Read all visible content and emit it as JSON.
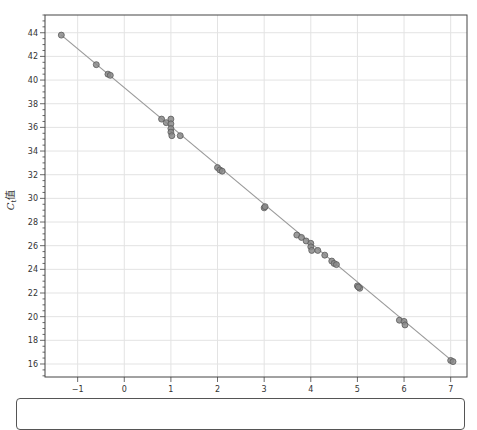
{
  "chart_data": {
    "type": "scatter",
    "title": "",
    "xlabel": "浓度",
    "ylabel_main": "C",
    "ylabel_sub": "t",
    "ylabel_suffix": "值",
    "xlim": [
      -1.7,
      7.35
    ],
    "ylim": [
      14.9,
      45.5
    ],
    "xticks": [
      -1,
      0,
      1,
      2,
      3,
      4,
      5,
      6,
      7
    ],
    "yticks": [
      16,
      18,
      20,
      22,
      24,
      26,
      28,
      30,
      32,
      34,
      36,
      38,
      40,
      42,
      44
    ],
    "grid": true,
    "legend": null,
    "regression_line": {
      "x": [
        -1.35,
        7.05
      ],
      "y": [
        43.8,
        16.2
      ]
    },
    "series": [
      {
        "name": "samples",
        "points": [
          [
            -1.35,
            43.8
          ],
          [
            -0.6,
            41.3
          ],
          [
            -0.35,
            40.5
          ],
          [
            -0.3,
            40.4
          ],
          [
            0.8,
            36.7
          ],
          [
            0.9,
            36.4
          ],
          [
            1.0,
            36.7
          ],
          [
            1.0,
            36.3
          ],
          [
            1.0,
            35.9
          ],
          [
            1.0,
            35.6
          ],
          [
            1.02,
            35.3
          ],
          [
            1.2,
            35.3
          ],
          [
            2.0,
            32.6
          ],
          [
            2.05,
            32.4
          ],
          [
            2.1,
            32.3
          ],
          [
            3.0,
            29.2
          ],
          [
            3.02,
            29.3
          ],
          [
            3.7,
            26.9
          ],
          [
            3.8,
            26.7
          ],
          [
            3.9,
            26.4
          ],
          [
            4.0,
            26.2
          ],
          [
            4.0,
            25.9
          ],
          [
            4.02,
            25.6
          ],
          [
            4.15,
            25.6
          ],
          [
            4.3,
            25.2
          ],
          [
            4.45,
            24.7
          ],
          [
            4.5,
            24.5
          ],
          [
            4.55,
            24.4
          ],
          [
            5.0,
            22.6
          ],
          [
            5.05,
            22.4
          ],
          [
            5.02,
            22.5
          ],
          [
            5.9,
            19.7
          ],
          [
            6.0,
            19.6
          ],
          [
            6.02,
            19.3
          ],
          [
            7.0,
            16.3
          ],
          [
            7.05,
            16.2
          ]
        ]
      }
    ],
    "colors": {
      "marker_fill": "#8a8a8a",
      "marker_edge": "#5a5a5a",
      "line": "#9a9a9a",
      "grid": "#e3e3e3",
      "axis": "#444444"
    }
  }
}
